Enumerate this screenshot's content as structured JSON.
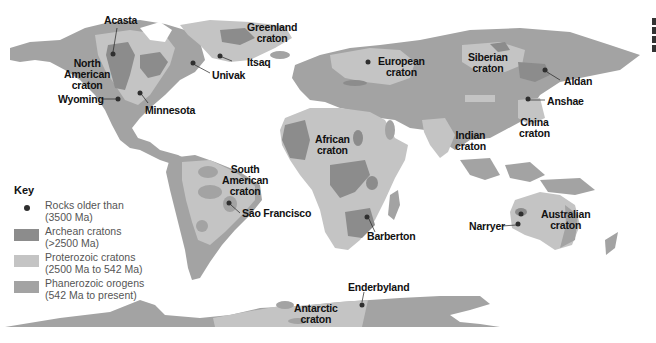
{
  "colors": {
    "ocean": "#ffffff",
    "archean": "#8c8c8c",
    "proterozoic": "#c4c4c4",
    "phanerozoic": "#a3a3a3",
    "rock_dot": "#2f2f2f",
    "label": "#111111",
    "key_text": "#555555"
  },
  "cratons": [
    {
      "id": "north-american",
      "line1": "North",
      "line2": "American",
      "line3": "craton"
    },
    {
      "id": "greenland",
      "line1": "Greenland",
      "line2": "craton"
    },
    {
      "id": "european",
      "line1": "European",
      "line2": "craton"
    },
    {
      "id": "siberian",
      "line1": "Siberian",
      "line2": "craton"
    },
    {
      "id": "african",
      "line1": "African",
      "line2": "craton"
    },
    {
      "id": "indian",
      "line1": "Indian",
      "line2": "craton"
    },
    {
      "id": "china",
      "line1": "China",
      "line2": "craton"
    },
    {
      "id": "south-american",
      "line1": "South",
      "line2": "American",
      "line3": "craton"
    },
    {
      "id": "australian",
      "line1": "Australian",
      "line2": "craton"
    },
    {
      "id": "antarctic",
      "line1": "Antarctic",
      "line2": "craton"
    }
  ],
  "rock_sites": [
    {
      "id": "acasta",
      "label": "Acasta"
    },
    {
      "id": "wyoming",
      "label": "Wyoming"
    },
    {
      "id": "minnesota",
      "label": "Minnesota"
    },
    {
      "id": "univak",
      "label": "Univak"
    },
    {
      "id": "itsaq",
      "label": "Itsaq"
    },
    {
      "id": "aldan",
      "label": "Aldan"
    },
    {
      "id": "anshae",
      "label": "Anshae"
    },
    {
      "id": "sao-francisco",
      "label": "São Francisco"
    },
    {
      "id": "barberton",
      "label": "Barberton"
    },
    {
      "id": "narryer",
      "label": "Narryer"
    },
    {
      "id": "enderbyland",
      "label": "Enderbyland"
    }
  ],
  "key": {
    "title": "Key",
    "items": [
      {
        "type": "dot",
        "line1": "Rocks older than",
        "line2": "(3500 Ma)"
      },
      {
        "type": "archean",
        "line1": "Archean cratons",
        "line2": "(>2500 Ma)"
      },
      {
        "type": "proterozoic",
        "line1": "Proterozoic cratons",
        "line2": "(2500 Ma to 542 Ma)"
      },
      {
        "type": "phanerozoic",
        "line1": "Phanerozoic orogens",
        "line2": "(542 Ma to present)"
      }
    ]
  }
}
